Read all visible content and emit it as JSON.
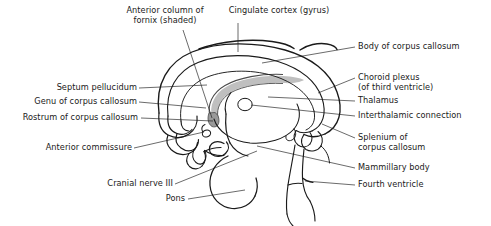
{
  "figure": {
    "type": "anatomical-diagram",
    "background_color": "#ffffff",
    "line_color": "#1a1a1a",
    "shading_color": "#b8b8b8",
    "text_color": "#1a1a1a"
  },
  "labels": {
    "anterior_column_of_fornix": {
      "line1": "Anterior column of",
      "line2": "fornix (shaded)"
    },
    "cingulate_cortex": {
      "line1": "Cingulate cortex (gyrus)"
    },
    "body_of_corpus_callosum": {
      "line1": "Body of corpus callosum"
    },
    "choroid_plexus": {
      "line1": "Choroid plexus",
      "line2": "(of third ventricle)"
    },
    "thalamus": {
      "line1": "Thalamus"
    },
    "interthalamic_connection": {
      "line1": "Interthalamic connection"
    },
    "splenium_of_corpus_callosum": {
      "line1": "Splenium of",
      "line2": "corpus callosum"
    },
    "mammillary_body": {
      "line1": "Mammillary body"
    },
    "fourth_ventricle": {
      "line1": "Fourth ventricle"
    },
    "septum_pellucidum": {
      "line1": "Septum pellucidum"
    },
    "genu_of_corpus_callosum": {
      "line1": "Genu of corpus callosum"
    },
    "rostrum_of_corpus_callosum": {
      "line1": "Rostrum of corpus callosum"
    },
    "anterior_commissure": {
      "line1": "Anterior commissure"
    },
    "cranial_nerve_iii": {
      "line1": "Cranial nerve III"
    },
    "pons": {
      "line1": "Pons"
    }
  }
}
